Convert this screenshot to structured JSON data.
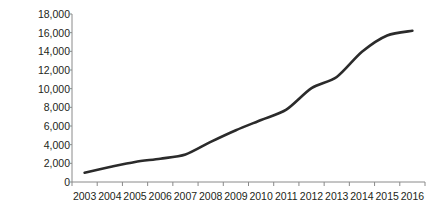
{
  "chart_data": {
    "type": "line",
    "title": "",
    "subtitle": "",
    "xlabel": "",
    "ylabel": "Rand million",
    "categories": [
      2003,
      2004,
      2005,
      2006,
      2007,
      2008,
      2009,
      2010,
      2011,
      2012,
      2013,
      2014,
      2015,
      2016
    ],
    "values": [
      1000,
      1600,
      2150,
      2500,
      2950,
      4300,
      5550,
      6650,
      7750,
      10050,
      11250,
      13950,
      15700,
      16200
    ],
    "series": [
      {
        "name": "Rand million",
        "values": [
          1000,
          1600,
          2150,
          2500,
          2950,
          4300,
          5550,
          6650,
          7750,
          10050,
          11250,
          13950,
          15700,
          16200
        ]
      }
    ],
    "ylim": [
      0,
      18000
    ],
    "ytick_values": [
      0,
      2000,
      4000,
      6000,
      8000,
      10000,
      12000,
      14000,
      16000,
      18000
    ],
    "ytick_labels": [
      "0",
      "2,000",
      "4,000",
      "6,000",
      "8,000",
      "10,000",
      "12,000",
      "14,000",
      "16,000",
      "18,000"
    ],
    "xtick_labels": [
      "2003",
      "2004",
      "2005",
      "2006",
      "2007",
      "2008",
      "2009",
      "2010",
      "2011",
      "2012",
      "2013",
      "2014",
      "2015",
      "2016"
    ],
    "grid": false,
    "legend": false,
    "legend_position": "none",
    "annotations": [],
    "line_color": "#2b2b2b",
    "axis_color": "#8a8a8a",
    "text_color": "#231f20",
    "background_color": "#ffffff"
  }
}
